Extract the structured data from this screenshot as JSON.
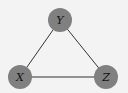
{
  "diagram": {
    "type": "undirected-graph",
    "background": "#f3f3f3",
    "node_color": "#808080",
    "edge_color": "#333333",
    "nodes": [
      {
        "id": "Y",
        "label": "Y",
        "cx": 60,
        "cy": 20
      },
      {
        "id": "X",
        "label": "X",
        "cx": 20,
        "cy": 77
      },
      {
        "id": "Z",
        "label": "Z",
        "cx": 106,
        "cy": 77
      }
    ],
    "edges": [
      {
        "from": "X",
        "to": "Y"
      },
      {
        "from": "Y",
        "to": "Z"
      },
      {
        "from": "X",
        "to": "Z"
      }
    ]
  }
}
